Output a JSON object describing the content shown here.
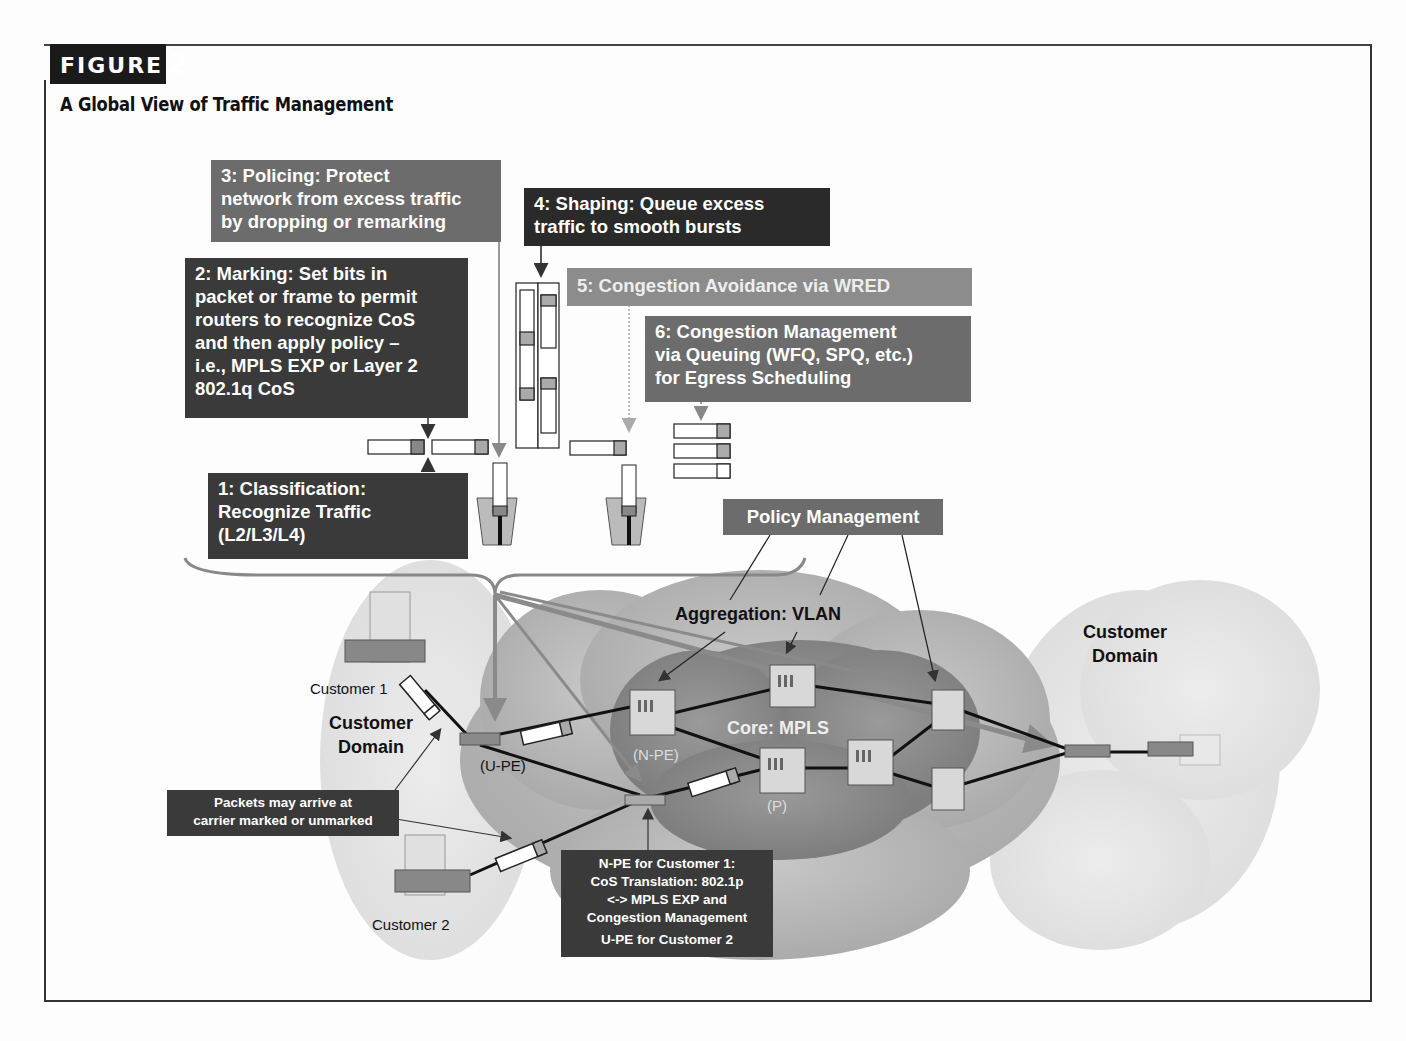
{
  "figure": {
    "tag": "FIGURE",
    "number": "2",
    "title": "A Global View of Traffic Management"
  },
  "steps": {
    "classification": [
      "1:  Classification:",
      "Recognize Traffic",
      "(L2/L3/L4)"
    ],
    "marking": [
      "2:  Marking:  Set bits in",
      "packet or frame to permit",
      "routers to recognize CoS",
      "and then apply policy –",
      "i.e., MPLS EXP or Layer 2",
      "802.1q CoS"
    ],
    "policing": [
      "3:  Policing:  Protect",
      "network from excess traffic",
      "by dropping or remarking"
    ],
    "shaping": [
      "4:  Shaping:  Queue excess",
      "traffic to smooth bursts"
    ],
    "congestion_avoidance": [
      "5:  Congestion Avoidance via WRED"
    ],
    "congestion_management": [
      "6:  Congestion Management",
      "via Queuing (WFQ, SPQ, etc.)",
      "for Egress Scheduling"
    ]
  },
  "policy_management": "Policy Management",
  "network": {
    "aggregation_label": "Aggregation:  VLAN",
    "core_label": "Core:  MPLS",
    "n_pe_label": "(N-PE)",
    "p_label": "(P)",
    "u_pe_label": "(U-PE)",
    "left_domain": [
      "Customer",
      "Domain"
    ],
    "right_domain": [
      "Customer",
      "Domain"
    ],
    "customer1": "Customer 1",
    "customer2": "Customer 2"
  },
  "callouts": {
    "packets": [
      "Packets may arrive at",
      "carrier marked or unmarked"
    ],
    "npe": [
      "N-PE for Customer 1:",
      "CoS Translation:  802.1p",
      "<-> MPLS EXP and",
      "Congestion Management"
    ],
    "npe_footer": "U-PE for Customer 2"
  },
  "colors": {
    "dark_box": "#3a3a3a",
    "mid_box": "#6c6c6c",
    "light_box": "#8c8c8c",
    "core_cloud": "#8a8a8a",
    "aggregation_cloud": "#b8b8b8",
    "customer_cloud": "#e6e6e6"
  }
}
